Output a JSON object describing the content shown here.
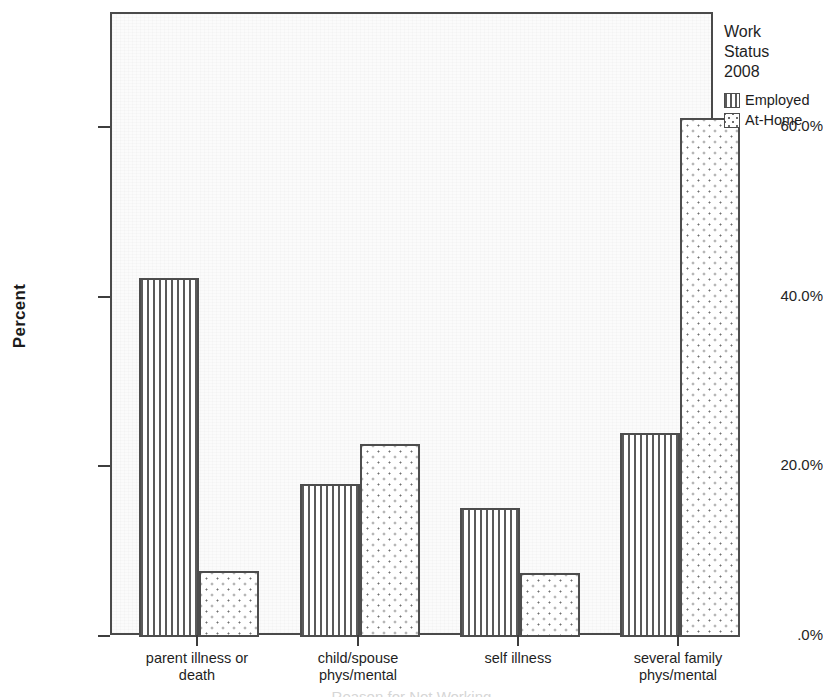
{
  "chart_data": {
    "type": "bar",
    "title": "",
    "xlabel": "",
    "ylabel": "Percent",
    "ylim": [
      0,
      72
    ],
    "grid": false,
    "legend_position": "right",
    "categories": [
      "parent illness or death",
      "child/spouse phys/mental",
      "self illness",
      "several family phys/mental"
    ],
    "series": [
      {
        "name": "Employed",
        "values": [
          42.3,
          18.0,
          15.2,
          24.0
        ]
      },
      {
        "name": "At-Home",
        "values": [
          7.8,
          22.8,
          7.5,
          61.2
        ]
      }
    ],
    "y_ticks": [
      0,
      20,
      40,
      60
    ],
    "y_tick_labels": [
      ".0%",
      "20.0%",
      "40.0%",
      "60.0%"
    ]
  },
  "axes": {
    "y_title": "Percent",
    "y_tick_labels": [
      ".0%",
      "20.0%",
      "40.0%",
      "60.0%"
    ],
    "x_tick_labels": [
      [
        "parent illness or",
        "death"
      ],
      [
        "child/spouse",
        "phys/mental"
      ],
      [
        "self illness",
        ""
      ],
      [
        "several family",
        "phys/mental"
      ]
    ]
  },
  "legend": {
    "title_lines": [
      "Work",
      "Status",
      "2008"
    ],
    "entries": [
      {
        "label": "Employed",
        "pattern": "vertical-lines"
      },
      {
        "label": "At-Home",
        "pattern": "dotted"
      }
    ]
  },
  "colors": {
    "bar_outline": "#4d4d4d",
    "employed_hatch": "#5a5a5a",
    "athome_dots": "#6e6e6e",
    "plot_background": "#fbfbfb",
    "axis": "#4a4a4a",
    "text": "#1f1f1f"
  },
  "caption": {
    "cut_off_text": "Reason for Not Working"
  }
}
